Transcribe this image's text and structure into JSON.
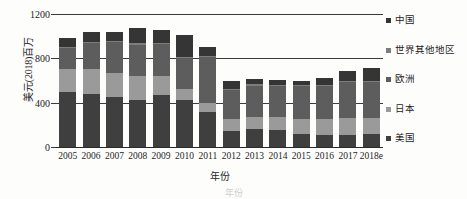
{
  "chart_data": {
    "type": "bar",
    "stacked": true,
    "title": "",
    "xlabel": "年份",
    "ylabel": "美元(2018)百万",
    "ylim": [
      0,
      1200
    ],
    "yticks": [
      0,
      400,
      800,
      1200
    ],
    "ytick_labels": [
      "0",
      "400",
      "800",
      "1200"
    ],
    "grid": true,
    "legend_position": "right",
    "categories": [
      "2005",
      "2006",
      "2007",
      "2008",
      "2009",
      "2010",
      "2011",
      "2012",
      "2013",
      "2014",
      "2015",
      "2016",
      "2017",
      "2018e"
    ],
    "series": [
      {
        "name": "美国",
        "color": "#3f3f3f",
        "values": [
          500,
          480,
          450,
          425,
          470,
          420,
          315,
          145,
          160,
          155,
          120,
          105,
          105,
          115
        ]
      },
      {
        "name": "日本",
        "color": "#9a9a9a",
        "values": [
          200,
          220,
          215,
          220,
          175,
          100,
          85,
          105,
          110,
          115,
          135,
          150,
          155,
          150
        ]
      },
      {
        "name": "欧洲",
        "color": "#5d5d5d",
        "values": [
          195,
          235,
          285,
          280,
          285,
          285,
          410,
          265,
          285,
          280,
          295,
          295,
          330,
          320
        ]
      },
      {
        "name": "世界其他地区",
        "color": "#7d7d7d",
        "values": [
          10,
          10,
          10,
          10,
          10,
          10,
          10,
          10,
          10,
          10,
          10,
          10,
          10,
          10
        ]
      },
      {
        "name": "中国",
        "color": "#353535",
        "values": [
          80,
          90,
          75,
          135,
          120,
          195,
          85,
          70,
          45,
          45,
          40,
          60,
          85,
          115
        ]
      }
    ],
    "totals": [
      985,
      1035,
      1035,
      1070,
      1060,
      1010,
      905,
      595,
      610,
      605,
      600,
      620,
      685,
      710
    ]
  },
  "legend": {
    "entries": [
      {
        "label": "中国",
        "color": "#353535"
      },
      {
        "label": "世界其他地区",
        "color": "#7d7d7d"
      },
      {
        "label": "欧洲",
        "color": "#5d5d5d"
      },
      {
        "label": "日本",
        "color": "#9a9a9a"
      },
      {
        "label": "美国",
        "color": "#3f3f3f"
      }
    ]
  },
  "caption": {
    "text": "年份"
  }
}
